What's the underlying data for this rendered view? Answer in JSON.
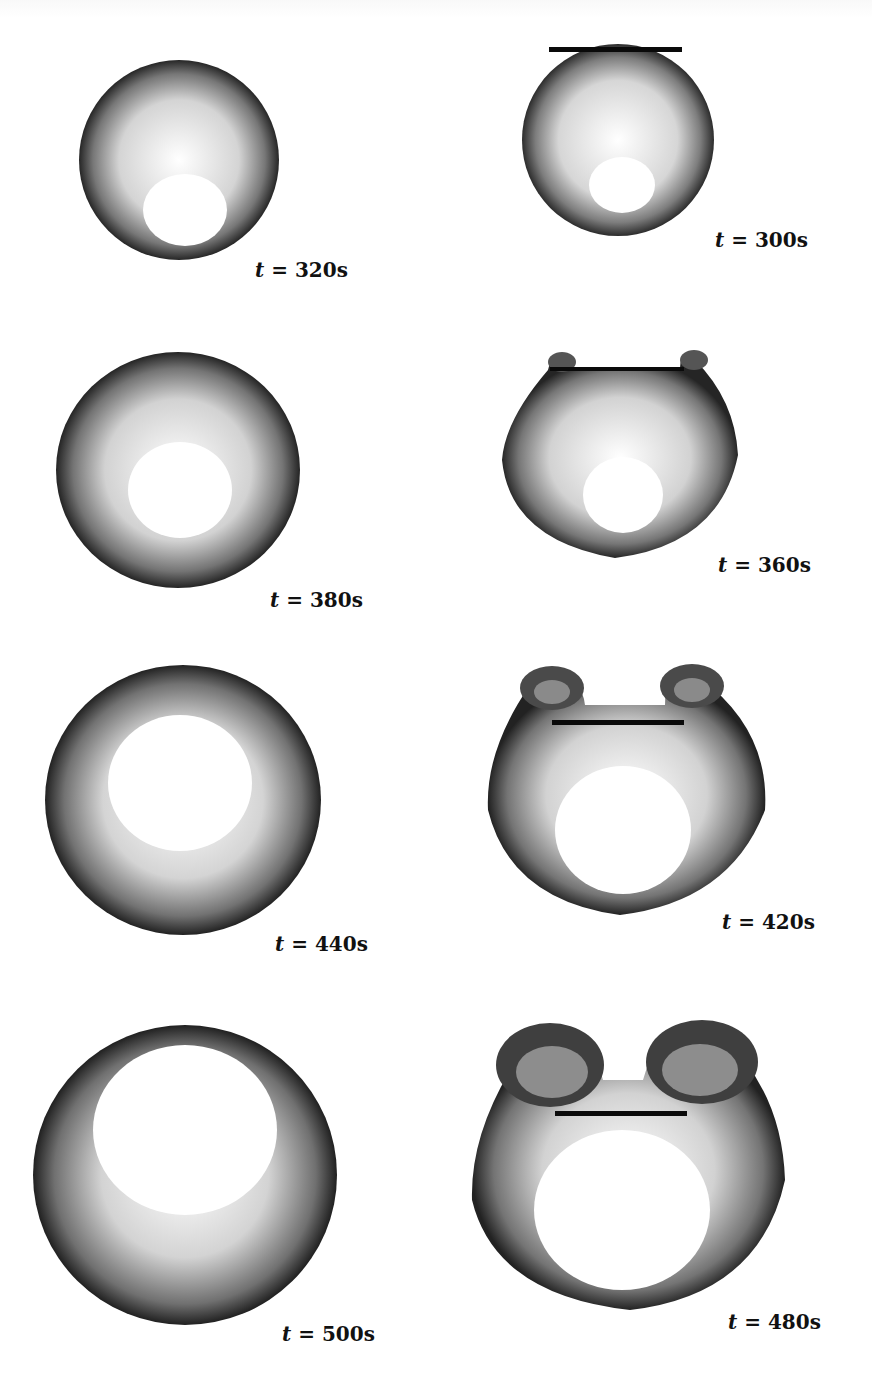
{
  "figure": {
    "layout": {
      "columns": 2,
      "rows": 4
    },
    "colors": {
      "particles": "#1a1a1a",
      "plate": "#0a0a0a",
      "background": "#ffffff"
    },
    "panels": [
      {
        "id": "p300",
        "label_var": "t",
        "label_eq": " = ",
        "label_val": "300s",
        "has_plate": true,
        "stage": "intact"
      },
      {
        "id": "p320",
        "label_var": "t",
        "label_eq": " = ",
        "label_val": "320s",
        "has_plate": false,
        "stage": "intact"
      },
      {
        "id": "p360",
        "label_var": "t",
        "label_eq": " = ",
        "label_val": "360s",
        "has_plate": true,
        "stage": "rollup-small"
      },
      {
        "id": "p380",
        "label_var": "t",
        "label_eq": " = ",
        "label_val": "380s",
        "has_plate": false,
        "stage": "ring"
      },
      {
        "id": "p420",
        "label_var": "t",
        "label_eq": " = ",
        "label_val": "420s",
        "has_plate": true,
        "stage": "rollup-medium"
      },
      {
        "id": "p440",
        "label_var": "t",
        "label_eq": " = ",
        "label_val": "440s",
        "has_plate": false,
        "stage": "ring-large"
      },
      {
        "id": "p480",
        "label_var": "t",
        "label_eq": " = ",
        "label_val": "480s",
        "has_plate": true,
        "stage": "rollup-large"
      },
      {
        "id": "p500",
        "label_var": "t",
        "label_eq": " = ",
        "label_val": "500s",
        "has_plate": false,
        "stage": "ring-larger"
      }
    ]
  }
}
